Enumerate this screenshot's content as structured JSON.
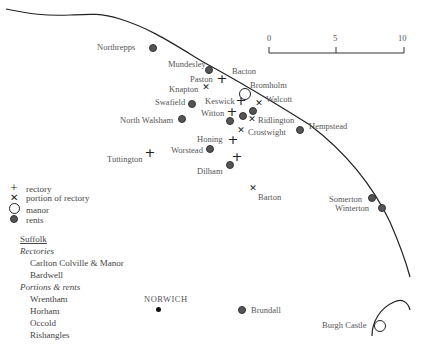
{
  "scale": {
    "ticks": [
      "0",
      "5",
      "10"
    ]
  },
  "places": [
    {
      "name": "Northrepps",
      "type": "rents",
      "x": 152,
      "y": 47,
      "label_x": 97,
      "label_y": 42
    },
    {
      "name": "Mundesley",
      "type": "rents",
      "x": 208,
      "y": 69,
      "label_x": 168,
      "label_y": 59
    },
    {
      "name": "Bacton",
      "type": "label",
      "label_x": 232,
      "label_y": 66
    },
    {
      "name": "Paston",
      "type": "rectory",
      "x": 221,
      "y": 79,
      "label_x": 190,
      "label_y": 74
    },
    {
      "name": "Knapton",
      "type": "portion",
      "x": 206,
      "y": 87,
      "label_x": 169,
      "label_y": 84
    },
    {
      "name": "Bromholm",
      "type": "manor",
      "x": 245,
      "y": 94,
      "label_x": 250,
      "label_y": 80
    },
    {
      "name": "Walcott",
      "type": "portion",
      "x": 259,
      "y": 103,
      "label_x": 266,
      "label_y": 94
    },
    {
      "name": "Swafield",
      "type": "rents",
      "x": 191,
      "y": 103,
      "label_x": 155,
      "label_y": 97
    },
    {
      "name": "Keswick",
      "type": "rectory",
      "x": 240,
      "y": 101,
      "label_x": 205,
      "label_y": 96
    },
    {
      "name": "Keswick rents",
      "type": "rents",
      "x": 252,
      "y": 110
    },
    {
      "name": "Witton",
      "type": "rectory",
      "x": 231,
      "y": 112,
      "label_x": 201,
      "label_y": 108
    },
    {
      "name": "Witton rents 1",
      "type": "rents",
      "x": 242,
      "y": 115
    },
    {
      "name": "Witton rents 2",
      "type": "rents",
      "x": 229,
      "y": 120
    },
    {
      "name": "Ridlington",
      "type": "portion",
      "x": 252,
      "y": 119,
      "label_x": 258,
      "label_y": 115
    },
    {
      "name": "North Walsham",
      "type": "rents",
      "x": 181,
      "y": 118,
      "label_x": 120,
      "label_y": 115
    },
    {
      "name": "Hempstead",
      "type": "rents",
      "x": 299,
      "y": 129,
      "label_x": 309,
      "label_y": 121
    },
    {
      "name": "Crostwight",
      "type": "portion",
      "x": 241,
      "y": 130,
      "label_x": 248,
      "label_y": 127
    },
    {
      "name": "Honing",
      "type": "rectory",
      "x": 232,
      "y": 140,
      "label_x": 197,
      "label_y": 134
    },
    {
      "name": "Worstead",
      "type": "rents",
      "x": 209,
      "y": 148,
      "label_x": 171,
      "label_y": 145
    },
    {
      "name": "Tuttington",
      "type": "rectory",
      "x": 149,
      "y": 153,
      "label_x": 107,
      "label_y": 154
    },
    {
      "name": "Dilham",
      "type": "rents",
      "x": 229,
      "y": 164,
      "label_x": 197,
      "label_y": 166
    },
    {
      "name": "Dilham rectory",
      "type": "rectory",
      "x": 236,
      "y": 157
    },
    {
      "name": "Barton",
      "type": "portion",
      "x": 253,
      "y": 188,
      "label_x": 258,
      "label_y": 192
    },
    {
      "name": "Somerton",
      "type": "rents",
      "x": 371,
      "y": 197,
      "label_x": 329,
      "label_y": 194
    },
    {
      "name": "Winterton",
      "type": "rents",
      "x": 381,
      "y": 207,
      "label_x": 335,
      "label_y": 203
    },
    {
      "name": "Brundall",
      "type": "rents",
      "x": 241,
      "y": 309,
      "label_x": 251,
      "label_y": 305
    },
    {
      "name": "Burgh Castle",
      "type": "manor",
      "x": 380,
      "y": 326,
      "label_x": 322,
      "label_y": 320
    }
  ],
  "norwich": {
    "name": "NORWICH",
    "x": 158,
    "y": 309,
    "label_x": 144,
    "label_y": 294
  },
  "legend": [
    {
      "symbol": "rectory",
      "label": "rectory"
    },
    {
      "symbol": "portion",
      "label": "portion of rectory"
    },
    {
      "symbol": "manor",
      "label": "manor"
    },
    {
      "symbol": "rents",
      "label": "rents"
    }
  ],
  "suffolk": {
    "heading": "Suffolk",
    "groups": [
      {
        "category": "Rectories",
        "items": [
          "Carlton Colville & Manor",
          "Bardwell"
        ]
      },
      {
        "category": "Portions & rents",
        "items": [
          "Wrentham",
          "Horham",
          "Occold",
          "Rishangles"
        ]
      }
    ]
  },
  "colors": {
    "ink": "#222222",
    "dot": "#555555",
    "text": "#555555"
  }
}
